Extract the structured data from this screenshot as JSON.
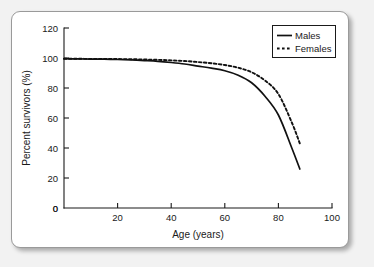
{
  "chart_data": {
    "type": "line",
    "title": "",
    "xlabel": "Age (years)",
    "ylabel": "Percent survivors (%)",
    "xlim": [
      0,
      100
    ],
    "ylim": [
      0,
      120
    ],
    "xticks": [
      "0",
      "20",
      "40",
      "60",
      "80",
      "100"
    ],
    "xtick_values": [
      0,
      20,
      40,
      60,
      80,
      100
    ],
    "yticks": [
      "0",
      "20",
      "40",
      "60",
      "80",
      "100",
      "120"
    ],
    "ytick_values": [
      0,
      20,
      40,
      60,
      80,
      100,
      120
    ],
    "grid": false,
    "legend_position": "top-right",
    "x": [
      0,
      5,
      10,
      15,
      20,
      25,
      30,
      35,
      40,
      45,
      50,
      55,
      60,
      65,
      70,
      75,
      80,
      85,
      88
    ],
    "series": [
      {
        "name": "Males",
        "style": "solid",
        "values": [
          99.5,
          99.4,
          99.3,
          99.2,
          99.0,
          98.7,
          98.3,
          97.8,
          97.0,
          96.0,
          94.6,
          93.2,
          91.5,
          88.5,
          83.5,
          74.5,
          62.0,
          40.0,
          26.0
        ]
      },
      {
        "name": "Females",
        "style": "dashed",
        "values": [
          99.5,
          99.5,
          99.4,
          99.4,
          99.3,
          99.2,
          99.0,
          98.8,
          98.4,
          98.0,
          97.3,
          96.5,
          95.3,
          93.5,
          90.5,
          85.0,
          76.0,
          57.0,
          43.0
        ]
      }
    ],
    "legend": [
      "Males",
      "Females"
    ],
    "annotations": [],
    "colors": {
      "series_line": "#111111",
      "axis": "#1a1a1a",
      "card_background": "#ffffff",
      "page_background": "#f2f2f2",
      "card_border": "#9a9a9a"
    }
  }
}
